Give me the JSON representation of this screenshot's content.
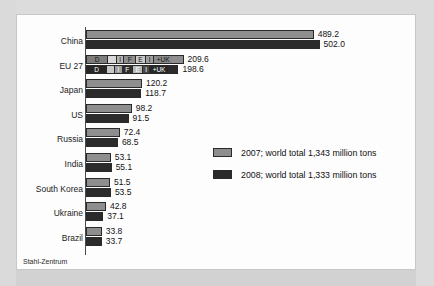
{
  "chart_data": {
    "type": "bar",
    "orientation": "horizontal",
    "title": "",
    "xlabel": "",
    "ylabel": "",
    "xlim": [
      0,
      520
    ],
    "grid": false,
    "legend_position": "center-right",
    "categories": [
      "China",
      "EU 27",
      "Japan",
      "US",
      "Russia",
      "India",
      "South Korea",
      "Ukraine",
      "Brazil"
    ],
    "series": [
      {
        "name": "2007; world total 1,343 million tons",
        "color": "#8e8e8e",
        "values": [
          489.2,
          209.6,
          120.2,
          98.2,
          72.4,
          53.1,
          51.5,
          42.8,
          33.8
        ],
        "labels": [
          "489.2",
          "209.6",
          "120.2",
          "98.2",
          "72.4",
          "53.1",
          "51.5",
          "42.8",
          "33.8"
        ]
      },
      {
        "name": "2008; world total 1,333 million tons",
        "color": "#2b2b2b",
        "values": [
          502.0,
          198.6,
          118.7,
          91.5,
          68.5,
          55.1,
          53.5,
          37.1,
          33.7
        ],
        "labels": [
          "502.0",
          "198.6",
          "118.7",
          "91.5",
          "68.5",
          "55.1",
          "53.5",
          "37.1",
          "33.7"
        ]
      }
    ],
    "segmented_category": "EU 27",
    "eu_segments_2007": [
      "D",
      "",
      "I",
      "F",
      "E",
      "I",
      "+UK"
    ],
    "eu_segments_2008": [
      "D",
      "",
      "I",
      "F",
      "E",
      "I",
      "+UK"
    ],
    "annotations": [
      "Stahl-Zentrum"
    ]
  },
  "legend": {
    "items": [
      {
        "label": "2007; world total 1,343 million tons",
        "color": "#8e8e8e"
      },
      {
        "label": "2008; world total 1,333 million tons",
        "color": "#2b2b2b"
      }
    ]
  },
  "source": {
    "text": "Stahl-Zentrum"
  },
  "colors": {
    "series_2007": "#8e8e8e",
    "series_2008": "#2b2b2b",
    "axis": "#4a4a4a",
    "card_background": "#fdfdfd",
    "page_background": "#d9d9d9"
  }
}
